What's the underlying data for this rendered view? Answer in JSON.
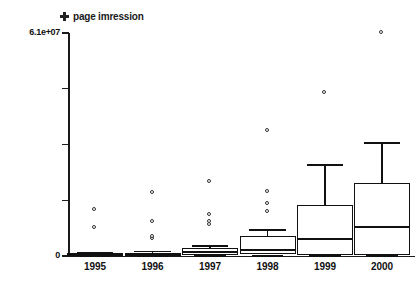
{
  "chart": {
    "title": "page imression",
    "marker_icon": "plus-marker-icon",
    "type": "boxplot"
  },
  "axes": {
    "y_labels": [
      "6.1e+07",
      "0"
    ],
    "y_top_label": "6.1e+07",
    "y_zero_label": "0",
    "x_labels": [
      "1995",
      "1996",
      "1997",
      "1998",
      "1999",
      "2000"
    ]
  },
  "chart_data": {
    "type": "box",
    "title": "page imression",
    "xlabel": "",
    "ylabel": "page imression",
    "categories": [
      "1995",
      "1996",
      "1997",
      "1998",
      "1999",
      "2000"
    ],
    "ylim": [
      0,
      61000000
    ],
    "ytick_labels": [
      "0",
      "6.1e+07"
    ],
    "ytick_values": [
      0,
      61000000
    ],
    "yticks_unlabeled": [
      15250000,
      30500000,
      45750000
    ],
    "grid": false,
    "legend": "page imression",
    "legend_position": "top-left",
    "boxes": [
      {
        "category": "1995",
        "whisker_low": 0,
        "q1": 0,
        "median": 300000,
        "q3": 700000,
        "whisker_high": 900000,
        "outliers": [
          7600000,
          12600000
        ]
      },
      {
        "category": "1996",
        "whisker_low": 0,
        "q1": 0,
        "median": 400000,
        "q3": 900000,
        "whisker_high": 1200000,
        "outliers": [
          4700000,
          5200000,
          9300000,
          17200000
        ]
      },
      {
        "category": "1997",
        "whisker_low": 0,
        "q1": 400000,
        "median": 1100000,
        "q3": 2200000,
        "whisker_high": 2700000,
        "outliers": [
          8500000,
          9300000,
          11200000,
          20200000
        ]
      },
      {
        "category": "1998",
        "whisker_low": 0,
        "q1": 600000,
        "median": 1700000,
        "q3": 5500000,
        "whisker_high": 7100000,
        "outliers": [
          12100000,
          14300000,
          17400000,
          34200000
        ]
      },
      {
        "category": "1999",
        "whisker_low": 0,
        "q1": 300000,
        "median": 4700000,
        "q3": 14000000,
        "whisker_high": 24900000,
        "outliers": [
          44600000
        ]
      },
      {
        "category": "2000",
        "whisker_low": 0,
        "q1": 300000,
        "median": 8000000,
        "q3": 20000000,
        "whisker_high": 30900000,
        "outliers": [
          61000000
        ]
      }
    ]
  }
}
